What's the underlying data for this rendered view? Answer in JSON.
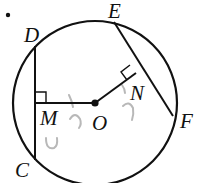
{
  "diagram": {
    "type": "circle-chords",
    "colors": {
      "stroke": "#111111",
      "pencil": "#b8b8b8",
      "background": "#ffffff"
    },
    "circle": {
      "center_label": "O",
      "cx": 95,
      "cy": 103,
      "r": 82
    },
    "points": {
      "D": {
        "label": "D",
        "x": 35,
        "y": 47
      },
      "C": {
        "label": "C",
        "x": 35,
        "y": 159
      },
      "M": {
        "label": "M",
        "x": 35,
        "y": 103
      },
      "O": {
        "label": "O",
        "x": 95,
        "y": 103
      },
      "E": {
        "label": "E",
        "x": 114,
        "y": 22
      },
      "F": {
        "label": "F",
        "x": 172,
        "y": 115
      },
      "N": {
        "label": "N",
        "x": 136,
        "y": 73
      }
    },
    "segments": [
      {
        "name": "chord-DC",
        "from": "D",
        "to": "C"
      },
      {
        "name": "chord-EF",
        "from": "E",
        "to": "F"
      },
      {
        "name": "segment-OM",
        "from": "O",
        "to": "M"
      },
      {
        "name": "segment-ON",
        "from": "O",
        "to": "N"
      }
    ],
    "right_angles": [
      "M",
      "N"
    ],
    "labels": {
      "D": "D",
      "E": "E",
      "M": "M",
      "O": "O",
      "N": "N",
      "F": "F",
      "C": "C"
    },
    "bullet": "•"
  }
}
